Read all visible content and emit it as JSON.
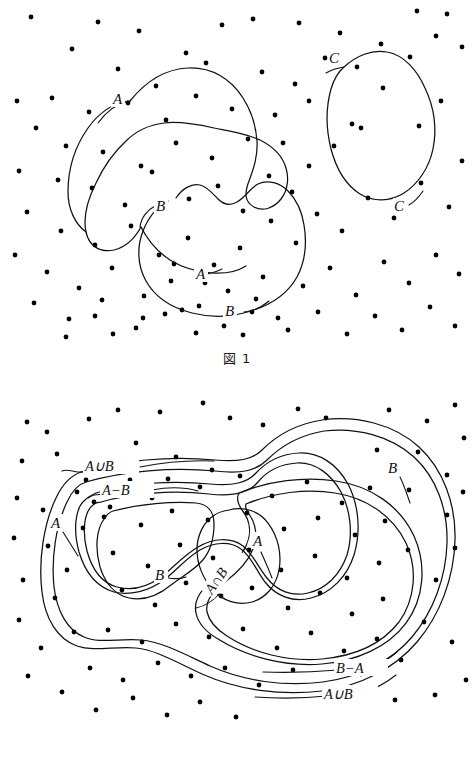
{
  "document": {
    "kind": "math-textbook-illustration",
    "topic": "set-diagrams",
    "background_color": "#ffffff",
    "ink_color": "#111111"
  },
  "figures": [
    {
      "id": "figure-1",
      "caption": "図 1",
      "caption_prefix": "図",
      "caption_number": "1",
      "labels": [
        {
          "id": "fig1-A-top",
          "text": "A",
          "x": 118,
          "y": 101
        },
        {
          "id": "fig1-B-left",
          "text": "B",
          "x": 161,
          "y": 208
        },
        {
          "id": "fig1-A-bottom",
          "text": "A",
          "x": 201,
          "y": 276
        },
        {
          "id": "fig1-B-bottom",
          "text": "B",
          "x": 230,
          "y": 313
        },
        {
          "id": "fig1-C-top",
          "text": "C",
          "x": 335,
          "y": 60
        },
        {
          "id": "fig1-C-bottom",
          "text": "C",
          "x": 400,
          "y": 208
        }
      ],
      "regions": [
        "A",
        "B",
        "C"
      ],
      "dot_count": 118
    },
    {
      "id": "figure-2",
      "caption": "図 2",
      "caption_prefix": "図",
      "caption_number": "2",
      "labels": [
        {
          "id": "fig2-AuB-top",
          "text": "A∪B",
          "x": 101,
          "y": 87
        },
        {
          "id": "fig2-AmB",
          "text": "A−B",
          "x": 118,
          "y": 112
        },
        {
          "id": "fig2-A-left",
          "text": "A",
          "x": 55,
          "y": 144
        },
        {
          "id": "fig2-B-mid",
          "text": "B",
          "x": 159,
          "y": 196
        },
        {
          "id": "fig2-AnB",
          "text": "A∩B",
          "x": 212,
          "y": 215,
          "rotation": -55
        },
        {
          "id": "fig2-A-mid",
          "text": "A",
          "x": 257,
          "y": 163
        },
        {
          "id": "fig2-B-right",
          "text": "B",
          "x": 392,
          "y": 89
        },
        {
          "id": "fig2-BmA",
          "text": "B−A",
          "x": 352,
          "y": 288
        },
        {
          "id": "fig2-AuB-bottom",
          "text": "A∪B",
          "x": 340,
          "y": 315
        }
      ],
      "regions": [
        "A",
        "B",
        "A∪B",
        "A∩B",
        "A−B",
        "B−A"
      ],
      "dot_count": 112
    }
  ],
  "fig1_dots": [
    [
      31,
      17
    ],
    [
      98,
      22
    ],
    [
      139,
      31
    ],
    [
      222,
      25
    ],
    [
      253,
      19
    ],
    [
      299,
      23
    ],
    [
      340,
      33
    ],
    [
      381,
      44
    ],
    [
      417,
      11
    ],
    [
      447,
      14
    ],
    [
      72,
      49
    ],
    [
      186,
      53
    ],
    [
      118,
      69
    ],
    [
      156,
      86
    ],
    [
      206,
      63
    ],
    [
      262,
      72
    ],
    [
      295,
      84
    ],
    [
      325,
      58
    ],
    [
      357,
      67
    ],
    [
      410,
      57
    ],
    [
      17,
      101
    ],
    [
      52,
      98
    ],
    [
      89,
      112
    ],
    [
      128,
      103
    ],
    [
      166,
      120
    ],
    [
      196,
      96
    ],
    [
      232,
      109
    ],
    [
      275,
      115
    ],
    [
      309,
      101
    ],
    [
      352,
      124
    ],
    [
      436,
      36
    ],
    [
      462,
      47
    ],
    [
      441,
      101
    ],
    [
      419,
      126
    ],
    [
      383,
      88
    ],
    [
      361,
      128
    ],
    [
      334,
      146
    ],
    [
      309,
      166
    ],
    [
      283,
      143
    ],
    [
      36,
      128
    ],
    [
      66,
      146
    ],
    [
      103,
      152
    ],
    [
      141,
      166
    ],
    [
      176,
      143
    ],
    [
      212,
      158
    ],
    [
      248,
      139
    ],
    [
      269,
      176
    ],
    [
      292,
      192
    ],
    [
      19,
      171
    ],
    [
      58,
      180
    ],
    [
      92,
      188
    ],
    [
      125,
      205
    ],
    [
      152,
      172
    ],
    [
      189,
      199
    ],
    [
      218,
      186
    ],
    [
      243,
      211
    ],
    [
      271,
      221
    ],
    [
      27,
      212
    ],
    [
      61,
      231
    ],
    [
      95,
      245
    ],
    [
      131,
      226
    ],
    [
      159,
      255
    ],
    [
      188,
      238
    ],
    [
      214,
      265
    ],
    [
      240,
      248
    ],
    [
      263,
      277
    ],
    [
      15,
      255
    ],
    [
      47,
      272
    ],
    [
      79,
      288
    ],
    [
      112,
      268
    ],
    [
      144,
      296
    ],
    [
      171,
      281
    ],
    [
      199,
      306
    ],
    [
      228,
      291
    ],
    [
      252,
      312
    ],
    [
      34,
      303
    ],
    [
      69,
      319
    ],
    [
      102,
      300
    ],
    [
      136,
      328
    ],
    [
      165,
      314
    ],
    [
      196,
      333
    ],
    [
      224,
      326
    ],
    [
      256,
      299
    ],
    [
      278,
      318
    ],
    [
      296,
      243
    ],
    [
      317,
      214
    ],
    [
      342,
      231
    ],
    [
      368,
      198
    ],
    [
      394,
      218
    ],
    [
      421,
      183
    ],
    [
      449,
      207
    ],
    [
      462,
      161
    ],
    [
      303,
      286
    ],
    [
      330,
      268
    ],
    [
      356,
      295
    ],
    [
      384,
      262
    ],
    [
      409,
      283
    ],
    [
      436,
      255
    ],
    [
      459,
      274
    ],
    [
      288,
      330
    ],
    [
      318,
      312
    ],
    [
      347,
      334
    ],
    [
      375,
      316
    ],
    [
      402,
      330
    ],
    [
      430,
      307
    ],
    [
      455,
      326
    ],
    [
      113,
      334
    ],
    [
      143,
      318
    ],
    [
      66,
      337
    ],
    [
      95,
      316
    ],
    [
      182,
      310
    ],
    [
      243,
      335
    ],
    [
      205,
      283
    ],
    [
      174,
      264
    ]
  ],
  "fig2_dots": [
    [
      27,
      42
    ],
    [
      47,
      52
    ],
    [
      89,
      39
    ],
    [
      118,
      30
    ],
    [
      160,
      32
    ],
    [
      203,
      23
    ],
    [
      230,
      38
    ],
    [
      263,
      45
    ],
    [
      298,
      29
    ],
    [
      326,
      38
    ],
    [
      389,
      30
    ],
    [
      427,
      41
    ],
    [
      455,
      25
    ],
    [
      464,
      58
    ],
    [
      22,
      81
    ],
    [
      57,
      74
    ],
    [
      96,
      85
    ],
    [
      136,
      63
    ],
    [
      176,
      77
    ],
    [
      212,
      90
    ],
    [
      390,
      86
    ],
    [
      418,
      72
    ],
    [
      447,
      95
    ],
    [
      17,
      118
    ],
    [
      43,
      130
    ],
    [
      77,
      112
    ],
    [
      110,
      127
    ],
    [
      152,
      118
    ],
    [
      86,
      100
    ],
    [
      447,
      135
    ],
    [
      463,
      112
    ],
    [
      14,
      158
    ],
    [
      48,
      166
    ],
    [
      83,
      148
    ],
    [
      67,
      190
    ],
    [
      23,
      200
    ],
    [
      55,
      218
    ],
    [
      19,
      240
    ],
    [
      94,
      122
    ],
    [
      130,
      100
    ],
    [
      168,
      99
    ],
    [
      200,
      107
    ],
    [
      240,
      96
    ],
    [
      272,
      116
    ],
    [
      307,
      102
    ],
    [
      342,
      123
    ],
    [
      370,
      108
    ],
    [
      104,
      137
    ],
    [
      141,
      145
    ],
    [
      172,
      131
    ],
    [
      208,
      140
    ],
    [
      247,
      133
    ],
    [
      284,
      149
    ],
    [
      318,
      138
    ],
    [
      355,
      155
    ],
    [
      385,
      141
    ],
    [
      113,
      173
    ],
    [
      148,
      186
    ],
    [
      180,
      165
    ],
    [
      213,
      178
    ],
    [
      249,
      170
    ],
    [
      281,
      190
    ],
    [
      315,
      176
    ],
    [
      347,
      198
    ],
    [
      379,
      183
    ],
    [
      122,
      210
    ],
    [
      155,
      225
    ],
    [
      186,
      203
    ],
    [
      221,
      216
    ],
    [
      252,
      208
    ],
    [
      288,
      228
    ],
    [
      320,
      213
    ],
    [
      352,
      234
    ],
    [
      383,
      219
    ],
    [
      108,
      250
    ],
    [
      142,
      262
    ],
    [
      176,
      244
    ],
    [
      209,
      257
    ],
    [
      243,
      249
    ],
    [
      277,
      268
    ],
    [
      311,
      253
    ],
    [
      344,
      271
    ],
    [
      377,
      259
    ],
    [
      90,
      288
    ],
    [
      123,
      300
    ],
    [
      158,
      283
    ],
    [
      191,
      296
    ],
    [
      225,
      288
    ],
    [
      259,
      305
    ],
    [
      293,
      290
    ],
    [
      327,
      308
    ],
    [
      361,
      294
    ],
    [
      41,
      268
    ],
    [
      74,
      252
    ],
    [
      28,
      296
    ],
    [
      62,
      312
    ],
    [
      96,
      330
    ],
    [
      133,
      318
    ],
    [
      167,
      335
    ],
    [
      200,
      322
    ],
    [
      236,
      337
    ],
    [
      408,
      170
    ],
    [
      436,
      200
    ],
    [
      455,
      168
    ],
    [
      424,
      242
    ],
    [
      452,
      262
    ],
    [
      401,
      280
    ],
    [
      435,
      315
    ],
    [
      466,
      300
    ],
    [
      395,
      320
    ],
    [
      409,
      110
    ],
    [
      377,
      70
    ]
  ]
}
